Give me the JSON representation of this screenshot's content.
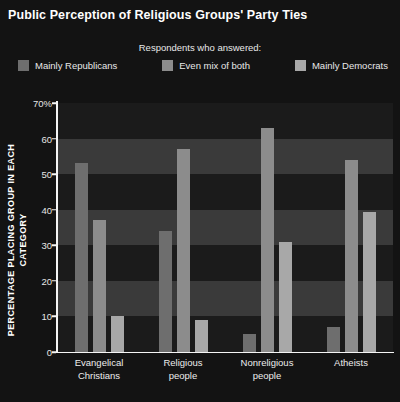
{
  "title": "Public Perception of Religious Groups' Party Ties",
  "legend": {
    "caption": "Respondents who answered:",
    "items": [
      {
        "label": "Mainly Republicans",
        "color": "#6e6e6e"
      },
      {
        "label": "Even mix of both",
        "color": "#8c8c8c"
      },
      {
        "label": "Mainly Democrats",
        "color": "#a8a8a8"
      }
    ]
  },
  "axes": {
    "y_label_line1": "PERCENTAGE PLACING GROUP",
    "y_label_line2": "IN EACH CATEGORY",
    "y_ticks": [
      "70%",
      "60",
      "50",
      "40",
      "30",
      "20",
      "10",
      "0"
    ],
    "y_tick_values": [
      70,
      60,
      50,
      40,
      30,
      20,
      10,
      0
    ]
  },
  "chart_data": {
    "type": "bar",
    "title": "Public Perception of Religious Groups' Party Ties",
    "subtitle": "Respondents who answered:",
    "xlabel": "",
    "ylabel": "PERCENTAGE PLACING GROUP IN EACH CATEGORY",
    "ylim": [
      0,
      70
    ],
    "grid": true,
    "legend_position": "top",
    "categories": [
      [
        "Evangelical",
        "Christians"
      ],
      [
        "Religious",
        "people"
      ],
      [
        "Nonreligious",
        "people"
      ],
      [
        "Atheists"
      ]
    ],
    "category_labels": [
      "Evangelical Christians",
      "Religious people",
      "Nonreligious people",
      "Atheists"
    ],
    "series": [
      {
        "name": "Mainly Republicans",
        "color": "#6e6e6e",
        "values": [
          53,
          34,
          5,
          7
        ]
      },
      {
        "name": "Even mix of both",
        "color": "#8c8c8c",
        "values": [
          37,
          57,
          63,
          54
        ]
      },
      {
        "name": "Mainly Democrats",
        "color": "#a8a8a8",
        "values": [
          10,
          9,
          31,
          39.5
        ]
      }
    ]
  },
  "style": {
    "background": "#131313",
    "plot_background": "#1b1b1b",
    "band_color": "#3a3a3a",
    "axis_color": "#f5f5f5",
    "text_color": "#f2f2f2"
  }
}
